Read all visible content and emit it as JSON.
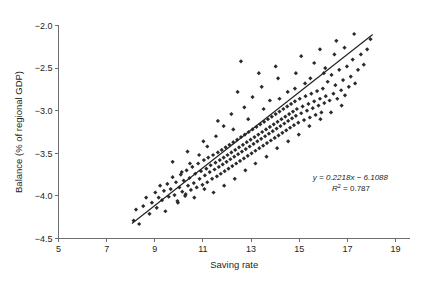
{
  "chart_data": {
    "type": "scatter",
    "title": "",
    "xlabel": "Saving rate",
    "ylabel": "Balance (% of regional GDP)",
    "xlim": [
      5,
      19.6
    ],
    "ylim": [
      -4.5,
      -2.0
    ],
    "xticks": [
      5,
      7,
      9,
      11,
      13,
      15,
      17,
      19
    ],
    "xticklabels": [
      "5",
      "7",
      "9",
      "11",
      "13",
      "15",
      "17",
      "19"
    ],
    "yticks": [
      -2.0,
      -2.5,
      -3.0,
      -3.5,
      -4.0,
      -4.5
    ],
    "yticklabels": [
      "−2.0",
      "−2.5",
      "−3.0",
      "−3.5",
      "−4.0",
      "−4.5"
    ],
    "grid": false,
    "legend": null,
    "annotations": {
      "equation": "y = 0.2218x − 6.1088",
      "r_squared": "R2 = 0.787",
      "r_squared_label": "R",
      "r_squared_exp": "2",
      "r_squared_value": " = 0.787"
    },
    "trendline": {
      "slope": 0.2218,
      "intercept": -6.1088,
      "x_start": 8.05,
      "x_end": 18.05,
      "y_start": -4.324,
      "y_end": -2.105
    },
    "marker": {
      "shape": "diamond",
      "size": 2.1,
      "color": "#2b2b2b"
    },
    "n_points": 212,
    "points": [
      [
        8.12,
        -4.29
      ],
      [
        8.22,
        -4.16
      ],
      [
        8.35,
        -4.33
      ],
      [
        8.52,
        -4.12
      ],
      [
        8.64,
        -4.02
      ],
      [
        8.78,
        -4.21
      ],
      [
        8.88,
        -4.08
      ],
      [
        9.02,
        -3.96
      ],
      [
        9.08,
        -4.14
      ],
      [
        9.16,
        -4.02
      ],
      [
        9.22,
        -3.88
      ],
      [
        9.3,
        -4.05
      ],
      [
        9.38,
        -3.94
      ],
      [
        9.44,
        -4.18
      ],
      [
        9.52,
        -3.86
      ],
      [
        9.58,
        -4.01
      ],
      [
        9.66,
        -3.92
      ],
      [
        9.74,
        -3.78
      ],
      [
        9.82,
        -3.99
      ],
      [
        9.88,
        -3.84
      ],
      [
        9.94,
        -4.06
      ],
      [
        10.02,
        -3.9
      ],
      [
        10.08,
        -3.75
      ],
      [
        10.14,
        -3.95
      ],
      [
        10.2,
        -3.82
      ],
      [
        10.26,
        -4.0
      ],
      [
        10.32,
        -3.7
      ],
      [
        10.38,
        -3.88
      ],
      [
        10.44,
        -3.79
      ],
      [
        10.5,
        -3.93
      ],
      [
        10.56,
        -3.66
      ],
      [
        10.62,
        -3.85
      ],
      [
        10.68,
        -3.74
      ],
      [
        10.74,
        -3.9
      ],
      [
        10.8,
        -3.62
      ],
      [
        10.86,
        -3.8
      ],
      [
        10.92,
        -3.71
      ],
      [
        10.98,
        -3.87
      ],
      [
        11.04,
        -3.58
      ],
      [
        11.08,
        -3.76
      ],
      [
        11.14,
        -3.68
      ],
      [
        11.18,
        -3.84
      ],
      [
        11.22,
        -3.55
      ],
      [
        11.28,
        -3.72
      ],
      [
        11.32,
        -3.64
      ],
      [
        11.38,
        -3.8
      ],
      [
        11.42,
        -3.52
      ],
      [
        11.48,
        -3.69
      ],
      [
        11.52,
        -3.61
      ],
      [
        11.58,
        -3.77
      ],
      [
        11.62,
        -3.49
      ],
      [
        11.66,
        -3.66
      ],
      [
        11.7,
        -3.58
      ],
      [
        11.74,
        -3.74
      ],
      [
        11.78,
        -3.46
      ],
      [
        11.82,
        -3.63
      ],
      [
        11.86,
        -3.55
      ],
      [
        11.9,
        -3.71
      ],
      [
        11.94,
        -3.43
      ],
      [
        11.98,
        -3.6
      ],
      [
        12.02,
        -3.52
      ],
      [
        12.06,
        -3.68
      ],
      [
        12.1,
        -3.4
      ],
      [
        12.14,
        -3.57
      ],
      [
        12.18,
        -3.49
      ],
      [
        12.22,
        -3.65
      ],
      [
        12.26,
        -3.37
      ],
      [
        12.3,
        -3.54
      ],
      [
        12.34,
        -3.46
      ],
      [
        12.38,
        -3.62
      ],
      [
        12.42,
        -3.34
      ],
      [
        12.46,
        -3.51
      ],
      [
        12.5,
        -3.43
      ],
      [
        12.54,
        -3.59
      ],
      [
        12.58,
        -3.31
      ],
      [
        12.62,
        -3.48
      ],
      [
        12.66,
        -3.4
      ],
      [
        12.7,
        -3.56
      ],
      [
        12.74,
        -3.28
      ],
      [
        12.78,
        -3.45
      ],
      [
        12.82,
        -3.37
      ],
      [
        12.86,
        -3.53
      ],
      [
        12.9,
        -3.25
      ],
      [
        12.94,
        -3.42
      ],
      [
        12.98,
        -3.34
      ],
      [
        13.02,
        -3.5
      ],
      [
        13.06,
        -3.22
      ],
      [
        13.1,
        -3.39
      ],
      [
        13.14,
        -3.31
      ],
      [
        13.18,
        -3.47
      ],
      [
        13.22,
        -3.19
      ],
      [
        13.26,
        -3.36
      ],
      [
        13.3,
        -3.28
      ],
      [
        13.34,
        -3.44
      ],
      [
        13.38,
        -3.16
      ],
      [
        13.42,
        -3.33
      ],
      [
        13.46,
        -3.25
      ],
      [
        13.5,
        -3.41
      ],
      [
        13.54,
        -3.13
      ],
      [
        13.58,
        -3.3
      ],
      [
        13.62,
        -3.22
      ],
      [
        13.66,
        -3.38
      ],
      [
        13.7,
        -3.1
      ],
      [
        13.74,
        -3.27
      ],
      [
        13.78,
        -3.19
      ],
      [
        13.82,
        -3.35
      ],
      [
        13.86,
        -3.07
      ],
      [
        13.9,
        -3.24
      ],
      [
        13.94,
        -3.16
      ],
      [
        13.98,
        -3.32
      ],
      [
        14.02,
        -3.04
      ],
      [
        14.06,
        -3.21
      ],
      [
        14.1,
        -3.13
      ],
      [
        14.14,
        -3.29
      ],
      [
        14.18,
        -3.01
      ],
      [
        14.22,
        -3.18
      ],
      [
        14.26,
        -3.1
      ],
      [
        14.3,
        -3.26
      ],
      [
        14.34,
        -2.98
      ],
      [
        14.38,
        -3.15
      ],
      [
        14.42,
        -3.07
      ],
      [
        14.46,
        -3.23
      ],
      [
        14.5,
        -2.95
      ],
      [
        14.54,
        -3.12
      ],
      [
        14.58,
        -3.04
      ],
      [
        14.62,
        -3.2
      ],
      [
        14.66,
        -2.92
      ],
      [
        14.7,
        -3.09
      ],
      [
        14.74,
        -3.01
      ],
      [
        14.78,
        -3.17
      ],
      [
        14.82,
        -2.89
      ],
      [
        14.86,
        -3.06
      ],
      [
        14.9,
        -2.98
      ],
      [
        14.96,
        -3.14
      ],
      [
        15.02,
        -2.86
      ],
      [
        15.08,
        -3.03
      ],
      [
        15.14,
        -2.95
      ],
      [
        15.2,
        -3.11
      ],
      [
        15.26,
        -2.83
      ],
      [
        15.32,
        -3.0
      ],
      [
        15.38,
        -2.92
      ],
      [
        15.44,
        -3.08
      ],
      [
        15.5,
        -2.8
      ],
      [
        15.56,
        -2.97
      ],
      [
        15.62,
        -2.89
      ],
      [
        15.68,
        -3.05
      ],
      [
        15.74,
        -2.77
      ],
      [
        15.8,
        -2.94
      ],
      [
        15.86,
        -2.86
      ],
      [
        15.92,
        -3.02
      ],
      [
        15.98,
        -2.74
      ],
      [
        16.04,
        -2.91
      ],
      [
        16.1,
        -2.83
      ],
      [
        16.18,
        -2.66
      ],
      [
        16.26,
        -2.88
      ],
      [
        16.34,
        -2.58
      ],
      [
        16.42,
        -2.8
      ],
      [
        16.5,
        -2.7
      ],
      [
        16.58,
        -2.86
      ],
      [
        16.66,
        -2.52
      ],
      [
        16.74,
        -2.76
      ],
      [
        16.82,
        -2.64
      ],
      [
        16.9,
        -2.82
      ],
      [
        16.98,
        -2.48
      ],
      [
        17.06,
        -2.72
      ],
      [
        17.14,
        -2.6
      ],
      [
        17.22,
        -2.4
      ],
      [
        17.32,
        -2.68
      ],
      [
        17.44,
        -2.52
      ],
      [
        17.56,
        -2.34
      ],
      [
        17.68,
        -2.46
      ],
      [
        17.82,
        -2.28
      ],
      [
        17.96,
        -2.16
      ],
      [
        12.44,
        -2.78
      ],
      [
        12.72,
        -2.96
      ],
      [
        13.06,
        -2.84
      ],
      [
        13.44,
        -2.72
      ],
      [
        13.78,
        -2.88
      ],
      [
        14.12,
        -2.62
      ],
      [
        14.52,
        -2.78
      ],
      [
        14.86,
        -2.56
      ],
      [
        15.24,
        -2.68
      ],
      [
        15.62,
        -2.44
      ],
      [
        16.02,
        -2.56
      ],
      [
        16.46,
        -2.34
      ],
      [
        16.88,
        -2.26
      ],
      [
        12.18,
        -3.04
      ],
      [
        11.86,
        -3.18
      ],
      [
        11.54,
        -3.3
      ],
      [
        11.18,
        -3.42
      ],
      [
        10.84,
        -3.52
      ],
      [
        10.46,
        -3.62
      ],
      [
        10.12,
        -3.72
      ],
      [
        9.74,
        -3.6
      ],
      [
        10.36,
        -3.48
      ],
      [
        11.02,
        -3.36
      ],
      [
        11.62,
        -3.12
      ],
      [
        12.26,
        -3.22
      ],
      [
        12.88,
        -3.1
      ],
      [
        13.52,
        -2.98
      ],
      [
        14.18,
        -2.86
      ],
      [
        14.82,
        -2.74
      ],
      [
        15.46,
        -2.62
      ],
      [
        16.08,
        -2.5
      ],
      [
        9.96,
        -4.08
      ],
      [
        10.28,
        -3.98
      ],
      [
        10.64,
        -4.02
      ],
      [
        11.06,
        -3.92
      ],
      [
        11.44,
        -3.96
      ],
      [
        11.88,
        -3.88
      ],
      [
        12.32,
        -3.8
      ],
      [
        12.76,
        -3.7
      ],
      [
        13.18,
        -3.62
      ],
      [
        13.64,
        -3.54
      ],
      [
        14.08,
        -3.44
      ],
      [
        14.54,
        -3.36
      ],
      [
        14.98,
        -3.28
      ],
      [
        15.42,
        -3.18
      ],
      [
        15.88,
        -3.1
      ],
      [
        16.32,
        -3.02
      ],
      [
        16.76,
        -2.94
      ],
      [
        12.58,
        -2.42
      ],
      [
        13.32,
        -2.56
      ],
      [
        14.02,
        -2.48
      ],
      [
        15.08,
        -2.36
      ],
      [
        15.86,
        -2.28
      ],
      [
        16.54,
        -2.18
      ],
      [
        17.28,
        -2.1
      ]
    ]
  }
}
